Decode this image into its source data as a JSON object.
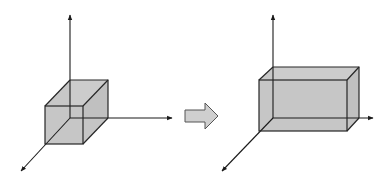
{
  "figure": {
    "colors": {
      "background": "#ffffff",
      "axis_stroke": "#1a1a1a",
      "solid_fill": "#c4c4c4",
      "arrow_fill": "#cfcfcf",
      "arrow_stroke": "#555555"
    },
    "panels": [
      {
        "id": "before",
        "shape": "cube",
        "axes": [
          "vertical-axis",
          "horizontal-axis",
          "depth-axis"
        ]
      },
      {
        "id": "after",
        "shape": "rectangular-box",
        "axes": [
          "vertical-axis",
          "horizontal-axis",
          "depth-axis"
        ]
      }
    ],
    "transition_icon": "right-block-arrow-icon"
  }
}
